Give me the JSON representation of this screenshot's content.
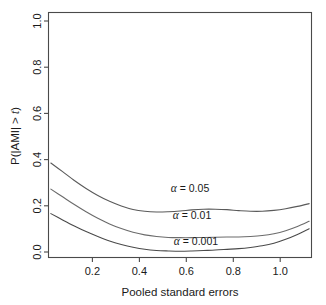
{
  "chart_data": {
    "type": "line",
    "title": "",
    "xlabel": "Pooled standard errors",
    "ylabel": "P(|AMI| > t)",
    "xlim": [
      0.04,
      1.16
    ],
    "ylim": [
      0.0,
      1.05
    ],
    "xticks": [
      0.2,
      0.4,
      0.6,
      0.8,
      1.0
    ],
    "xticklabels": [
      "0.2",
      "0.4",
      "0.6",
      "0.8",
      "1.0"
    ],
    "yticks": [
      0.0,
      0.2,
      0.4,
      0.6,
      0.8,
      1.0
    ],
    "yticklabels": [
      "0.0",
      "0.2",
      "0.4",
      "0.6",
      "0.8",
      "1.0"
    ],
    "grid": false,
    "legend": "inline-annotations",
    "x": [
      0.05,
      0.1,
      0.15,
      0.2,
      0.25,
      0.3,
      0.35,
      0.4,
      0.45,
      0.5,
      0.55,
      0.6,
      0.65,
      0.7,
      0.75,
      0.8,
      0.85,
      0.9,
      0.95,
      1.0,
      1.05,
      1.1,
      1.15
    ],
    "series": [
      {
        "name": "alpha = 0.05",
        "label": "α = 0.05",
        "color": "#5a5a5a",
        "values": [
          0.405,
          0.368,
          0.33,
          0.296,
          0.266,
          0.241,
          0.221,
          0.206,
          0.198,
          0.195,
          0.196,
          0.199,
          0.204,
          0.207,
          0.207,
          0.205,
          0.201,
          0.198,
          0.198,
          0.202,
          0.209,
          0.219,
          0.231
        ]
      },
      {
        "name": "alpha = 0.01",
        "label": "α = 0.01",
        "color": "#6b6b6b",
        "values": [
          0.293,
          0.26,
          0.227,
          0.196,
          0.168,
          0.144,
          0.124,
          0.108,
          0.097,
          0.09,
          0.086,
          0.085,
          0.085,
          0.086,
          0.087,
          0.088,
          0.088,
          0.09,
          0.094,
          0.102,
          0.115,
          0.133,
          0.155
        ]
      },
      {
        "name": "alpha = 0.001",
        "label": "α = 0.001",
        "color": "#4a4a4a",
        "values": [
          0.188,
          0.161,
          0.135,
          0.111,
          0.09,
          0.071,
          0.056,
          0.044,
          0.035,
          0.03,
          0.028,
          0.027,
          0.028,
          0.03,
          0.032,
          0.035,
          0.038,
          0.043,
          0.05,
          0.061,
          0.078,
          0.099,
          0.123
        ]
      }
    ],
    "annotations": [
      {
        "text": "α = 0.05",
        "x": 0.59,
        "y": 0.255
      },
      {
        "text": "α = 0.01",
        "x": 0.6,
        "y": 0.145
      },
      {
        "text": "α = 0.001",
        "x": 0.61,
        "y": 0.048
      }
    ]
  },
  "axis": {
    "x_title": "Pooled standard errors",
    "y_title_prefix": "P(|AMI| > ",
    "y_title_italic": "t",
    "y_title_suffix": ")",
    "y_title_full": "P(|AMI| > t)"
  },
  "colors": {
    "background": "#ffffff",
    "frame": "#4a4a4a",
    "text": "#1a1a1a"
  }
}
